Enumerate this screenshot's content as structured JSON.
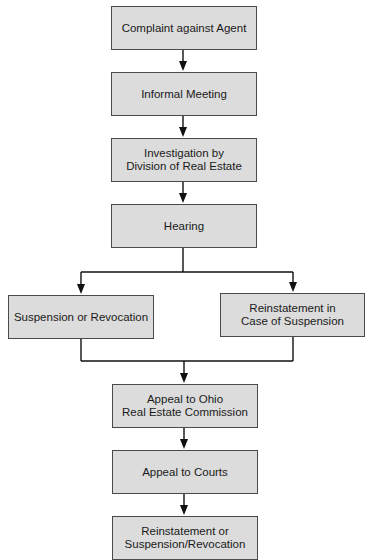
{
  "diagram": {
    "type": "flowchart",
    "nodes": [
      {
        "id": "complaint",
        "label": "Complaint against Agent"
      },
      {
        "id": "informal",
        "label": "Informal Meeting"
      },
      {
        "id": "investigation",
        "label": "Investigation by\nDivision of Real Estate"
      },
      {
        "id": "hearing",
        "label": "Hearing"
      },
      {
        "id": "suspension",
        "label": "Suspension or Revocation"
      },
      {
        "id": "reinstatement_case",
        "label": "Reinstatement in\nCase of Suspension"
      },
      {
        "id": "appeal_commission",
        "label": "Appeal to Ohio\nReal Estate Commission"
      },
      {
        "id": "appeal_courts",
        "label": "Appeal to Courts"
      },
      {
        "id": "final",
        "label": "Reinstatement or\nSuspension/Revocation"
      }
    ],
    "edges": [
      [
        "complaint",
        "informal"
      ],
      [
        "informal",
        "investigation"
      ],
      [
        "investigation",
        "hearing"
      ],
      [
        "hearing",
        "suspension"
      ],
      [
        "hearing",
        "reinstatement_case"
      ],
      [
        "suspension",
        "appeal_commission"
      ],
      [
        "reinstatement_case",
        "appeal_commission"
      ],
      [
        "appeal_commission",
        "appeal_courts"
      ],
      [
        "appeal_courts",
        "final"
      ]
    ],
    "colors": {
      "box_fill": "#dcdcdc",
      "box_border": "#4a4a4a",
      "line": "#111111"
    }
  }
}
